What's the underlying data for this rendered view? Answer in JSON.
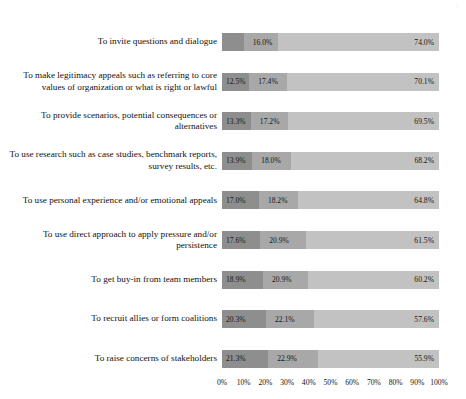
{
  "page_header": "|",
  "chart_data": {
    "type": "bar",
    "orientation": "horizontal",
    "stacked": true,
    "title": "",
    "xlabel": "",
    "ylabel": "",
    "xlim": [
      0,
      100
    ],
    "grid": false,
    "legend": "none",
    "xticks": [
      "0%",
      "10%",
      "20%",
      "30%",
      "40%",
      "50%",
      "60%",
      "70%",
      "80%",
      "90%",
      "100%"
    ],
    "xtick_values": [
      0,
      10,
      20,
      30,
      40,
      50,
      60,
      70,
      80,
      90,
      100
    ],
    "categories": [
      "To invite questions and dialogue",
      "To make legitimacy appeals such as referring to core values of organization or what is right or lawful",
      "To provide scenarios, potential consequences or alternatives",
      "To use research such as case studies, benchmark reports, survey results, etc.",
      "To use personal experience and/or emotional appeals",
      "To use direct approach to apply pressure and/or persistence",
      "To get buy-in from team members",
      "To recruit allies or form coalitions",
      "To raise concerns of stakeholders"
    ],
    "series": [
      {
        "name": "Segment 1",
        "color": "#8e8e8e",
        "values": [
          10.0,
          12.5,
          13.3,
          13.9,
          17.0,
          17.6,
          18.9,
          20.3,
          21.3
        ],
        "labels": [
          "10.0%",
          "12.5%",
          "13.3%",
          "13.9%",
          "17.0%",
          "17.6%",
          "18.9%",
          "20.3%",
          "21.3%"
        ]
      },
      {
        "name": "Segment 2",
        "color": "#a8a8a8",
        "values": [
          16.0,
          17.4,
          17.2,
          18.0,
          18.2,
          20.9,
          20.9,
          22.1,
          22.9
        ],
        "labels": [
          "16.0%",
          "17.4%",
          "17.2%",
          "18.0%",
          "18.2%",
          "20.9%",
          "20.9%",
          "22.1%",
          "22.9%"
        ]
      },
      {
        "name": "Segment 3",
        "color": "#c2c2c2",
        "values": [
          74.0,
          70.1,
          69.5,
          68.2,
          64.8,
          61.5,
          60.2,
          57.6,
          55.9
        ],
        "labels": [
          "74.0%",
          "70.1%",
          "69.5%",
          "68.2%",
          "64.8%",
          "61.5%",
          "60.2%",
          "57.6%",
          "55.9%"
        ]
      }
    ]
  }
}
